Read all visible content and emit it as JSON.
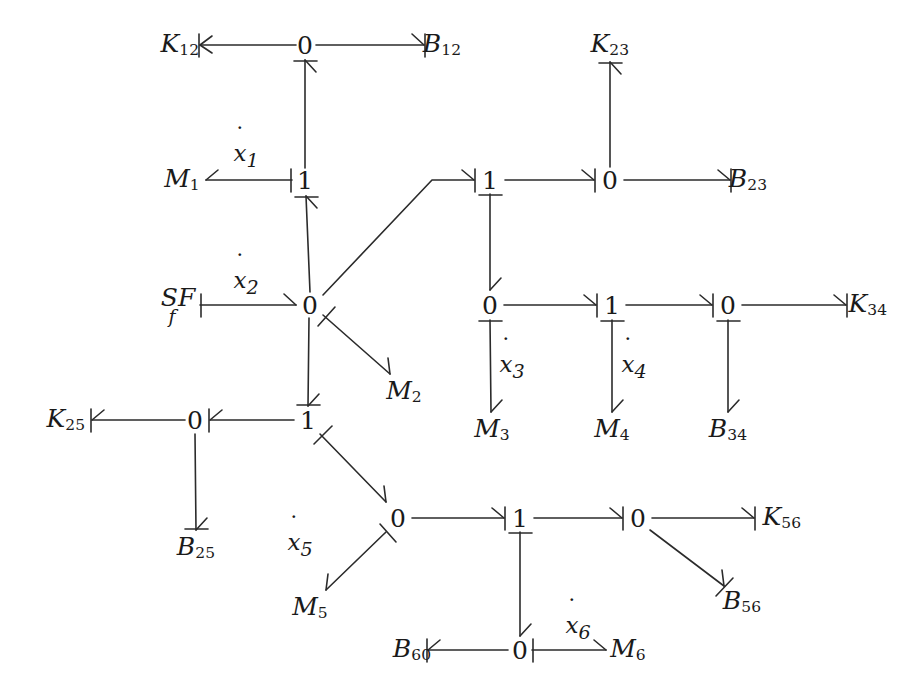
{
  "diagram": {
    "stroke_color": "#2b2b2b",
    "text_color": "#1a1a1a",
    "background": "#ffffff",
    "width": 922,
    "height": 696
  },
  "junctions": [
    {
      "id": "j0_top",
      "label": "0",
      "x": 305,
      "y": 45
    },
    {
      "id": "j1_x1",
      "label": "1",
      "x": 305,
      "y": 180
    },
    {
      "id": "j0_center",
      "label": "0",
      "x": 310,
      "y": 305
    },
    {
      "id": "j1_left",
      "label": "1",
      "x": 308,
      "y": 420
    },
    {
      "id": "j0_k25",
      "label": "0",
      "x": 195,
      "y": 420
    },
    {
      "id": "j1_x2b",
      "label": "1",
      "x": 490,
      "y": 180
    },
    {
      "id": "j0_k23",
      "label": "0",
      "x": 610,
      "y": 180
    },
    {
      "id": "j0_x3",
      "label": "0",
      "x": 490,
      "y": 305
    },
    {
      "id": "j1_x4",
      "label": "1",
      "x": 612,
      "y": 305
    },
    {
      "id": "j0_b34",
      "label": "0",
      "x": 728,
      "y": 305
    },
    {
      "id": "j0_x5",
      "label": "0",
      "x": 398,
      "y": 518
    },
    {
      "id": "j1_x6",
      "label": "1",
      "x": 520,
      "y": 518
    },
    {
      "id": "j0_k56",
      "label": "0",
      "x": 638,
      "y": 518
    },
    {
      "id": "j0_bottom",
      "label": "0",
      "x": 520,
      "y": 650
    }
  ],
  "elements": [
    {
      "id": "K12",
      "base": "K",
      "sub": "12",
      "x": 180,
      "y": 45
    },
    {
      "id": "B12",
      "base": "B",
      "sub": "12",
      "x": 442,
      "y": 45
    },
    {
      "id": "M1",
      "base": "M",
      "sub": "1",
      "x": 182,
      "y": 180
    },
    {
      "id": "K23",
      "base": "K",
      "sub": "23",
      "x": 610,
      "y": 45
    },
    {
      "id": "B23",
      "base": "B",
      "sub": "23",
      "x": 748,
      "y": 180
    },
    {
      "id": "M2",
      "base": "M",
      "sub": "2",
      "x": 404,
      "y": 392
    },
    {
      "id": "K34",
      "base": "K",
      "sub": "34",
      "x": 868,
      "y": 305
    },
    {
      "id": "M3",
      "base": "M",
      "sub": "3",
      "x": 492,
      "y": 430
    },
    {
      "id": "M4",
      "base": "M",
      "sub": "4",
      "x": 612,
      "y": 430
    },
    {
      "id": "B34",
      "base": "B",
      "sub": "34",
      "x": 728,
      "y": 430
    },
    {
      "id": "K25",
      "base": "K",
      "sub": "25",
      "x": 66,
      "y": 420
    },
    {
      "id": "B25",
      "base": "B",
      "sub": "25",
      "x": 196,
      "y": 548
    },
    {
      "id": "M5",
      "base": "M",
      "sub": "5",
      "x": 310,
      "y": 608
    },
    {
      "id": "K56",
      "base": "K",
      "sub": "56",
      "x": 782,
      "y": 518
    },
    {
      "id": "B56",
      "base": "B",
      "sub": "56",
      "x": 742,
      "y": 602
    },
    {
      "id": "B60",
      "base": "B",
      "sub": "60",
      "x": 412,
      "y": 650
    },
    {
      "id": "M6",
      "base": "M",
      "sub": "6",
      "x": 628,
      "y": 650
    }
  ],
  "source": {
    "id": "SF_f",
    "main": "SF",
    "sub": "f",
    "x": 178,
    "y": 305
  },
  "bond_labels": [
    {
      "id": "xdot1",
      "base": "x",
      "sub": "1",
      "x": 246,
      "y": 156
    },
    {
      "id": "xdot2",
      "base": "x",
      "sub": "2",
      "x": 246,
      "y": 283
    },
    {
      "id": "xdot3",
      "base": "x",
      "sub": "3",
      "x": 512,
      "y": 367
    },
    {
      "id": "xdot4",
      "base": "x",
      "sub": "4",
      "x": 634,
      "y": 367
    },
    {
      "id": "xdot5",
      "base": "x",
      "sub": "5",
      "x": 300,
      "y": 545
    },
    {
      "id": "xdot6",
      "base": "x",
      "sub": "6",
      "x": 578,
      "y": 628
    }
  ],
  "bonds": [
    {
      "id": "b-j0top-K12",
      "from": "j0_top",
      "to": "K12",
      "direction": "left",
      "causality": "at-head"
    },
    {
      "id": "b-j0top-B12",
      "from": "j0_top",
      "to": "B12",
      "direction": "right",
      "causality": "at-head"
    },
    {
      "id": "b-j1x1-j0top",
      "from": "j1_x1",
      "to": "j0_top",
      "direction": "up",
      "causality": "at-head"
    },
    {
      "id": "b-j1x1-M1",
      "from": "j1_x1",
      "to": "M1",
      "direction": "left",
      "causality": "at-tail"
    },
    {
      "id": "b-j0center-j1x1",
      "from": "j0_center",
      "to": "j1_x1",
      "direction": "up",
      "causality": "at-head"
    },
    {
      "id": "b-SF-j0center",
      "from": "SF_f",
      "to": "j0_center",
      "direction": "right",
      "causality": "at-tail"
    },
    {
      "id": "b-j0center-M2",
      "from": "j0_center",
      "to": "M2",
      "direction": "diag",
      "causality": "at-tail"
    },
    {
      "id": "b-j0center-j1x2b",
      "from": "j0_center",
      "to": "j1_x2b",
      "direction": "diag",
      "causality": "at-head"
    },
    {
      "id": "b-j0center-j1left",
      "from": "j0_center",
      "to": "j1_left",
      "direction": "down",
      "causality": "at-head"
    },
    {
      "id": "b-j1left-j0k25",
      "from": "j1_left",
      "to": "j0_k25",
      "direction": "left",
      "causality": "at-head"
    },
    {
      "id": "b-j0k25-K25",
      "from": "j0_k25",
      "to": "K25",
      "direction": "left",
      "causality": "at-head"
    },
    {
      "id": "b-j0k25-B25",
      "from": "j0_k25",
      "to": "B25",
      "direction": "down",
      "causality": "at-head"
    },
    {
      "id": "b-j1left-j0x5",
      "from": "j1_left",
      "to": "j0_x5",
      "direction": "diag",
      "causality": "at-tail"
    },
    {
      "id": "b-j1x2b-j0k23",
      "from": "j1_x2b",
      "to": "j0_k23",
      "direction": "right",
      "causality": "at-head"
    },
    {
      "id": "b-j0k23-K23",
      "from": "j0_k23",
      "to": "K23",
      "direction": "up",
      "causality": "at-head"
    },
    {
      "id": "b-j0k23-B23",
      "from": "j0_k23",
      "to": "B23",
      "direction": "right",
      "causality": "at-head"
    },
    {
      "id": "b-j1x2b-j0x3",
      "from": "j1_x2b",
      "to": "j0_x3",
      "direction": "down",
      "causality": "at-tail"
    },
    {
      "id": "b-j0x3-M3",
      "from": "j0_x3",
      "to": "M3",
      "direction": "down",
      "causality": "at-tail"
    },
    {
      "id": "b-j0x3-j1x4",
      "from": "j0_x3",
      "to": "j1_x4",
      "direction": "right",
      "causality": "at-head"
    },
    {
      "id": "b-j1x4-M4",
      "from": "j1_x4",
      "to": "M4",
      "direction": "down",
      "causality": "at-tail"
    },
    {
      "id": "b-j1x4-j0b34",
      "from": "j1_x4",
      "to": "j0_b34",
      "direction": "right",
      "causality": "at-head"
    },
    {
      "id": "b-j0b34-B34",
      "from": "j0_b34",
      "to": "B34",
      "direction": "down",
      "causality": "at-tail"
    },
    {
      "id": "b-j0b34-K34",
      "from": "j0_b34",
      "to": "K34",
      "direction": "right",
      "causality": "at-head"
    },
    {
      "id": "b-j0x5-M5",
      "from": "j0_x5",
      "to": "M5",
      "direction": "diag",
      "causality": "at-tail"
    },
    {
      "id": "b-j0x5-j1x6",
      "from": "j0_x5",
      "to": "j1_x6",
      "direction": "right",
      "causality": "at-head"
    },
    {
      "id": "b-j1x6-j0bottom",
      "from": "j1_x6",
      "to": "j0_bottom",
      "direction": "down",
      "causality": "at-tail"
    },
    {
      "id": "b-j0bottom-B60",
      "from": "j0_bottom",
      "to": "B60",
      "direction": "left",
      "causality": "at-head"
    },
    {
      "id": "b-j0bottom-M6",
      "from": "j0_bottom",
      "to": "M6",
      "direction": "right",
      "causality": "at-tail"
    },
    {
      "id": "b-j1x6-j0k56",
      "from": "j1_x6",
      "to": "j0_k56",
      "direction": "right",
      "causality": "at-head"
    },
    {
      "id": "b-j0k56-K56",
      "from": "j0_k56",
      "to": "K56",
      "direction": "right",
      "causality": "at-head"
    },
    {
      "id": "b-j0k56-B56",
      "from": "j0_k56",
      "to": "B56",
      "direction": "diag",
      "causality": "at-tail"
    }
  ],
  "geometry": {
    "segments": [
      {
        "id": "seg-K12",
        "x1": 296,
        "y1": 45,
        "x2": 200,
        "y2": 45
      },
      {
        "id": "seg-B12",
        "x1": 316,
        "y1": 45,
        "x2": 424,
        "y2": 45
      },
      {
        "id": "seg-j1x1-up",
        "x1": 305,
        "y1": 168,
        "x2": 305,
        "y2": 60
      },
      {
        "id": "seg-M1",
        "x1": 292,
        "y1": 180,
        "x2": 206,
        "y2": 180
      },
      {
        "id": "seg-j0c-j1x1",
        "x1": 310,
        "y1": 292,
        "x2": 306,
        "y2": 196
      },
      {
        "id": "seg-SF",
        "x1": 200,
        "y1": 305,
        "x2": 296,
        "y2": 305
      },
      {
        "id": "seg-M2",
        "x1": 323,
        "y1": 315,
        "x2": 390,
        "y2": 374
      },
      {
        "id": "seg-diag-a",
        "x1": 323,
        "y1": 295,
        "x2": 432,
        "y2": 180
      },
      {
        "id": "seg-diag-b",
        "x1": 432,
        "y1": 180,
        "x2": 474,
        "y2": 180
      },
      {
        "id": "seg-j0c-down",
        "x1": 309,
        "y1": 318,
        "x2": 308,
        "y2": 406
      },
      {
        "id": "seg-j1l-j0k25",
        "x1": 294,
        "y1": 420,
        "x2": 210,
        "y2": 420
      },
      {
        "id": "seg-K25",
        "x1": 185,
        "y1": 420,
        "x2": 92,
        "y2": 420
      },
      {
        "id": "seg-B25",
        "x1": 195,
        "y1": 434,
        "x2": 196,
        "y2": 530
      },
      {
        "id": "seg-j1l-j0x5",
        "x1": 320,
        "y1": 434,
        "x2": 386,
        "y2": 502
      },
      {
        "id": "seg-j1-j0k23",
        "x1": 505,
        "y1": 180,
        "x2": 594,
        "y2": 180
      },
      {
        "id": "seg-K23",
        "x1": 610,
        "y1": 167,
        "x2": 610,
        "y2": 62
      },
      {
        "id": "seg-B23",
        "x1": 624,
        "y1": 180,
        "x2": 730,
        "y2": 180
      },
      {
        "id": "seg-j1-j0x3",
        "x1": 490,
        "y1": 194,
        "x2": 490,
        "y2": 290
      },
      {
        "id": "seg-M3",
        "x1": 490,
        "y1": 320,
        "x2": 491,
        "y2": 412
      },
      {
        "id": "seg-j0x3-j1x4",
        "x1": 504,
        "y1": 305,
        "x2": 596,
        "y2": 305
      },
      {
        "id": "seg-M4",
        "x1": 612,
        "y1": 320,
        "x2": 612,
        "y2": 412
      },
      {
        "id": "seg-j1x4-j0",
        "x1": 626,
        "y1": 305,
        "x2": 712,
        "y2": 305
      },
      {
        "id": "seg-B34",
        "x1": 728,
        "y1": 320,
        "x2": 728,
        "y2": 412
      },
      {
        "id": "seg-K34",
        "x1": 742,
        "y1": 305,
        "x2": 846,
        "y2": 305
      },
      {
        "id": "seg-M5",
        "x1": 386,
        "y1": 532,
        "x2": 326,
        "y2": 590
      },
      {
        "id": "seg-j0x5-j1",
        "x1": 412,
        "y1": 518,
        "x2": 504,
        "y2": 518
      },
      {
        "id": "seg-j1x6-dn",
        "x1": 520,
        "y1": 532,
        "x2": 520,
        "y2": 636
      },
      {
        "id": "seg-B60",
        "x1": 508,
        "y1": 650,
        "x2": 428,
        "y2": 650
      },
      {
        "id": "seg-M6",
        "x1": 532,
        "y1": 650,
        "x2": 606,
        "y2": 650
      },
      {
        "id": "seg-j1-j0k56",
        "x1": 534,
        "y1": 518,
        "x2": 622,
        "y2": 518
      },
      {
        "id": "seg-K56",
        "x1": 652,
        "y1": 518,
        "x2": 754,
        "y2": 518
      },
      {
        "id": "seg-B56",
        "x1": 650,
        "y1": 530,
        "x2": 724,
        "y2": 586
      }
    ]
  }
}
